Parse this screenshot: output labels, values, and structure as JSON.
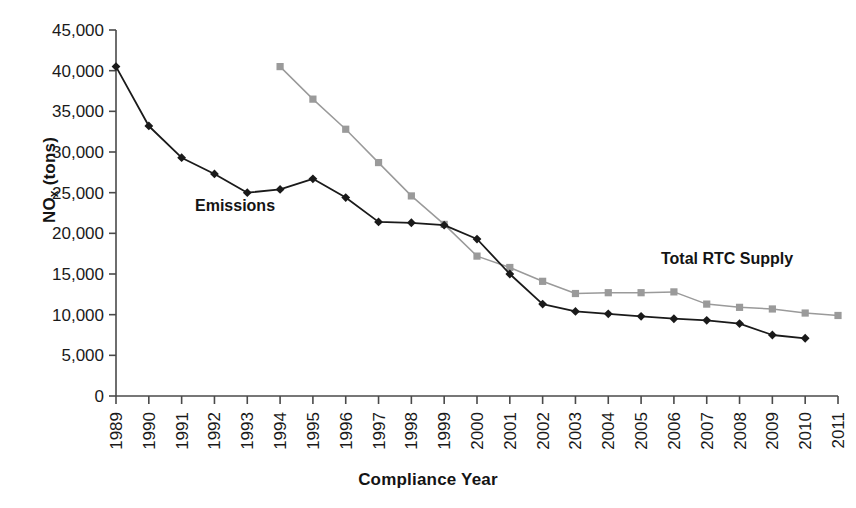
{
  "chart_data": {
    "type": "line",
    "title": "",
    "xlabel": "Compliance Year",
    "ylabel": "NOx (tons)",
    "ylabel_base": "NO",
    "ylabel_sub": "x",
    "ylabel_unit": " (tons)",
    "grid": false,
    "legend_position": "inline-annotations",
    "categories": [
      "1989",
      "1990",
      "1991",
      "1992",
      "1993",
      "1994",
      "1995",
      "1996",
      "1997",
      "1998",
      "1999",
      "2000",
      "2001",
      "2002",
      "2003",
      "2004",
      "2005",
      "2006",
      "2007",
      "2008",
      "2009",
      "2010",
      "2011"
    ],
    "ylim": [
      0,
      45000
    ],
    "yticks": [
      0,
      5000,
      10000,
      15000,
      20000,
      25000,
      30000,
      35000,
      40000,
      45000
    ],
    "ytick_labels": [
      "0",
      "5,000",
      "10,000",
      "15,000",
      "20,000",
      "25,000",
      "30,000",
      "35,000",
      "40,000",
      "45,000"
    ],
    "series": [
      {
        "name": "Emissions",
        "color": "#1a1a1a",
        "marker": "diamond",
        "x": [
          "1989",
          "1990",
          "1991",
          "1992",
          "1993",
          "1994",
          "1995",
          "1996",
          "1997",
          "1998",
          "1999",
          "2000",
          "2001",
          "2002",
          "2003",
          "2004",
          "2005",
          "2006",
          "2007",
          "2008",
          "2009",
          "2010"
        ],
        "values": [
          40500,
          33200,
          29300,
          27300,
          25000,
          25400,
          26700,
          24400,
          21400,
          21300,
          21000,
          19300,
          15000,
          11300,
          10400,
          10100,
          9800,
          9500,
          9300,
          8900,
          7500,
          7100
        ]
      },
      {
        "name": "Total RTC Supply",
        "color": "#9a9a9a",
        "marker": "square",
        "x": [
          "1994",
          "1995",
          "1996",
          "1997",
          "1998",
          "1999",
          "2000",
          "2001",
          "2002",
          "2003",
          "2004",
          "2005",
          "2006",
          "2007",
          "2008",
          "2009",
          "2010",
          "2011"
        ],
        "values": [
          40500,
          36500,
          32800,
          28700,
          24600,
          21100,
          17200,
          15800,
          14100,
          12600,
          12700,
          12700,
          12800,
          11300,
          10900,
          10700,
          10200,
          9900
        ]
      }
    ],
    "annotations": [
      {
        "text": "Emissions",
        "anchor_series": "Emissions"
      },
      {
        "text": "Total RTC Supply",
        "anchor_series": "Total RTC Supply"
      }
    ]
  }
}
